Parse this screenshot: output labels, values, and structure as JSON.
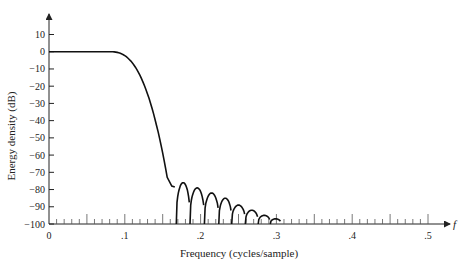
{
  "chart_data": {
    "type": "line",
    "title": "",
    "xlabel": "Frequency (cycles/sample)",
    "ylabel": "Energy density (dB)",
    "x_axis_symbol": "f",
    "xlim": [
      0,
      0.5
    ],
    "ylim": [
      -100,
      10
    ],
    "x_ticks": [
      0,
      0.1,
      0.2,
      0.3,
      0.4,
      0.5
    ],
    "x_tick_labels": [
      "0",
      ".1",
      ".2",
      ".3",
      ".4",
      ".5"
    ],
    "y_ticks": [
      10,
      0,
      -10,
      -20,
      -30,
      -40,
      -50,
      -60,
      -70,
      -80,
      -90,
      -100
    ],
    "y_tick_labels": [
      "10",
      "0",
      "−10",
      "−20",
      "−30",
      "−40",
      "−50",
      "−60",
      "−70",
      "−80",
      "−90",
      "−100"
    ],
    "grid": false,
    "legend": null,
    "series": [
      {
        "name": "Energy density",
        "x": [
          0,
          0.02,
          0.04,
          0.06,
          0.08,
          0.09,
          0.1,
          0.11,
          0.12,
          0.13,
          0.14,
          0.15,
          0.155,
          0.16,
          0.165,
          0.17
        ],
        "y": [
          0,
          0,
          0,
          0,
          0,
          -0.3,
          -1.5,
          -4,
          -9,
          -17,
          -30,
          -50,
          -63,
          -77,
          -78,
          -100
        ]
      }
    ],
    "sidelobes": {
      "centers": [
        0.175,
        0.195,
        0.215,
        0.232,
        0.25,
        0.267,
        0.284,
        0.3
      ],
      "peaks_db": [
        -76,
        -79,
        -82,
        -85,
        -89,
        -92,
        -95,
        -97
      ],
      "nulls": [
        0.168,
        0.186,
        0.205,
        0.224,
        0.241,
        0.259,
        0.276,
        0.292,
        0.306
      ]
    }
  }
}
